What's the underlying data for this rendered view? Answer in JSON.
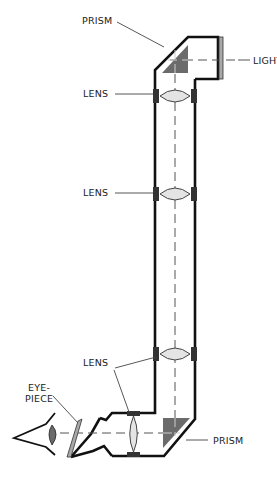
{
  "diagram": {
    "type": "periscope cross-section",
    "labels": {
      "prism_top": "PRISM",
      "light": "LIGHT",
      "lens_1": "LENS",
      "lens_2": "LENS",
      "lens_3": "LENS",
      "eyepiece_line1": "EYE-",
      "eyepiece_line2": "PIECE",
      "prism_bottom": "PRISM"
    },
    "components": [
      {
        "name": "top prism",
        "kind": "prism"
      },
      {
        "name": "light window",
        "kind": "window"
      },
      {
        "name": "upper lens",
        "kind": "lens"
      },
      {
        "name": "middle lens",
        "kind": "lens"
      },
      {
        "name": "lower lens",
        "kind": "lens"
      },
      {
        "name": "bottom prism",
        "kind": "prism"
      },
      {
        "name": "eyepiece lens",
        "kind": "lens"
      },
      {
        "name": "eyepiece glass",
        "kind": "window"
      },
      {
        "name": "eye",
        "kind": "observer"
      }
    ],
    "colors": {
      "outline": "#111111",
      "prism_fill": "#6b6b6b",
      "lens_fill": "#e4e4e4",
      "mount_fill": "#333333",
      "background": "#ffffff"
    }
  }
}
